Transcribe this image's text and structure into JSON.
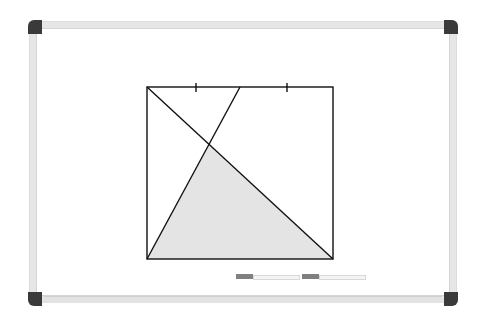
{
  "whiteboard": {
    "frame_color": "#e6e6e6",
    "cap_color": "#3a3a3a",
    "markers": [
      {
        "name": "marker-1",
        "tip_color": "#808080",
        "x": 236
      },
      {
        "name": "marker-2",
        "tip_color": "#808080",
        "x": 302
      }
    ]
  },
  "figure": {
    "type": "geometry",
    "shape": "square",
    "square": {
      "x1": 147,
      "y1": 87,
      "x2": 333,
      "y2": 259
    },
    "top_midpoint": {
      "x": 240,
      "y": 87
    },
    "tick_marks": [
      {
        "x": 196,
        "y": 87
      },
      {
        "x": 287,
        "y": 87
      }
    ],
    "segments": [
      {
        "from": "top-left",
        "to": "bottom-right"
      },
      {
        "from": "bottom-left",
        "to": "top-midpoint"
      }
    ],
    "shaded_region": {
      "description": "triangle bounded by bottom side, diagonal, and line from bottom-left to top midpoint",
      "fill": "#e4e4e4"
    },
    "stroke_color": "#111111"
  }
}
